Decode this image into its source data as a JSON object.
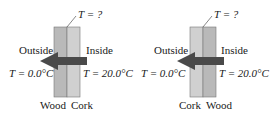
{
  "diagrams": [
    {
      "id": "left",
      "unknown_label": "T = ?",
      "outside_label": "Outside",
      "inside_label": "Inside",
      "outside_temp": "T = 0.0°C",
      "inside_temp": "T = 20.0°C",
      "layer_left": "Wood",
      "layer_right": "Cork"
    },
    {
      "id": "right",
      "unknown_label": "T = ?",
      "outside_label": "Outside",
      "inside_label": "Inside",
      "outside_temp": "T = 0.0°C",
      "inside_temp": "T = 20.0°C",
      "layer_left": "Cork",
      "layer_right": "Wood"
    }
  ],
  "colors": {
    "wood": "#b9b9b9",
    "cork": "#cfcfcf",
    "arrow": "#4a4a4a",
    "line": "#555555"
  }
}
